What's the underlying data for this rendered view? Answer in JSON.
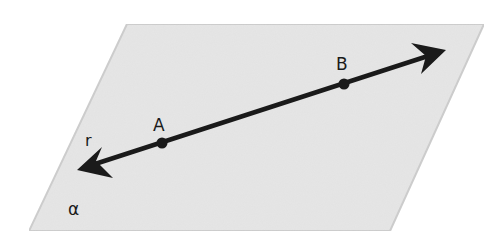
{
  "diagram": {
    "plane": {
      "label": "α",
      "corners": [
        [
          127,
          24
        ],
        [
          484,
          24
        ],
        [
          390,
          231
        ],
        [
          29,
          231
        ]
      ],
      "fill": "#e6e6e6",
      "stroke": "#cdcdcd"
    },
    "line": {
      "label": "r",
      "start": [
        77,
        170
      ],
      "end": [
        446,
        50
      ],
      "color": "#1a1a1a"
    },
    "points": [
      {
        "label": "A",
        "x": 162,
        "y": 143
      },
      {
        "label": "B",
        "x": 344,
        "y": 84
      }
    ],
    "labels": {
      "plane": "α",
      "line": "r",
      "point_a": "A",
      "point_b": "B"
    }
  }
}
